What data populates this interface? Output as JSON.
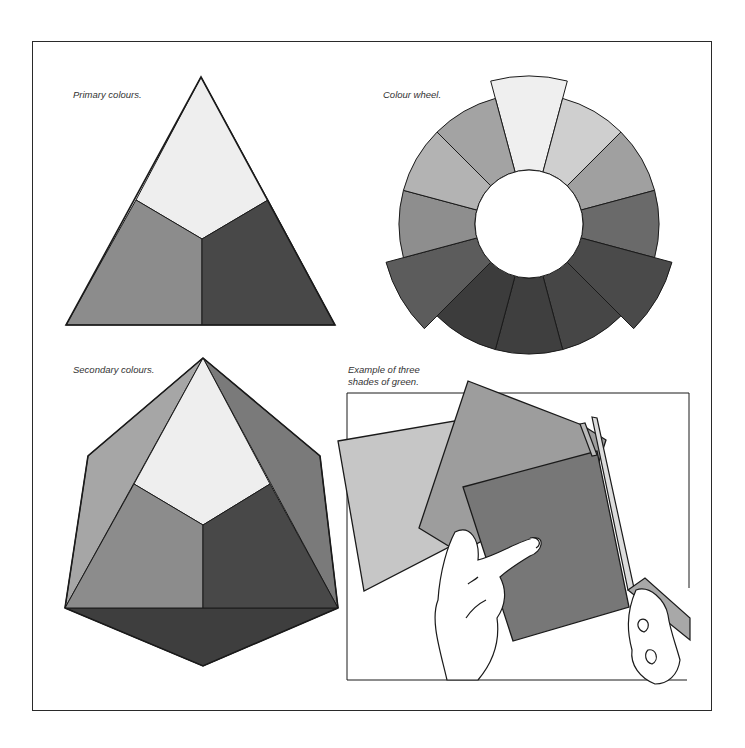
{
  "panels": {
    "primary": {
      "caption": "Primary colours.",
      "shades": {
        "top": "#eeeeee",
        "left": "#8c8c8c",
        "right": "#484848"
      }
    },
    "wheel": {
      "caption": "Colour wheel.",
      "segments": [
        "#efefef",
        "#cfcfcf",
        "#a0a0a0",
        "#6a6a6a",
        "#4a4a4a",
        "#464646",
        "#3f3f3f",
        "#3c3c3c",
        "#5c5c5c",
        "#8e8e8e",
        "#b3b3b3",
        "#a3a3a3",
        "#c5c5c5"
      ],
      "primary_indices": [
        0,
        4,
        8
      ]
    },
    "secondary": {
      "caption": "Secondary colours.",
      "shades": {
        "top": "#eeeeee",
        "left": "#8c8c8c",
        "right": "#484848",
        "outer_left": "#a6a6a6",
        "outer_right": "#7a7a7a",
        "bottom": "#3e3e3e"
      }
    },
    "greens": {
      "caption_line1": "Example of three",
      "caption_line2": "shades of green.",
      "shades": {
        "light": "#c6c6c6",
        "medium": "#9d9d9d",
        "dark": "#777777"
      }
    }
  }
}
